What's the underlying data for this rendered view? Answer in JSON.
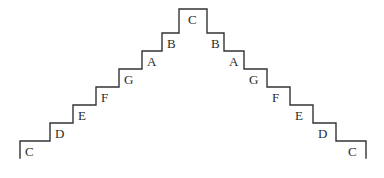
{
  "figure": {
    "kind": "staircase-diagram",
    "line_color": "#333333",
    "label_color": "#2b2b2b",
    "background_color": "#ffffff",
    "stroke_width": 1.4,
    "geometry": {
      "left_start_x": 20,
      "right_end_x": 366,
      "baseline_y": 141,
      "peak_y": 9,
      "tread_width": 23,
      "riser_height": 18,
      "tick_drop": 17
    },
    "steps_ascending": [
      {
        "label": "C",
        "index": 0,
        "tread_y": 141,
        "tread_x1": 20,
        "tread_x2": 50,
        "label_x": 25,
        "label_y": 145
      },
      {
        "label": "D",
        "index": 1,
        "tread_y": 123,
        "tread_x1": 50,
        "tread_x2": 73,
        "label_x": 55,
        "label_y": 127
      },
      {
        "label": "E",
        "index": 2,
        "tread_y": 105,
        "tread_x1": 73,
        "tread_x2": 96,
        "label_x": 78,
        "label_y": 109
      },
      {
        "label": "F",
        "index": 3,
        "tread_y": 87,
        "tread_x1": 96,
        "tread_x2": 119,
        "label_x": 101,
        "label_y": 91
      },
      {
        "label": "G",
        "index": 4,
        "tread_y": 69,
        "tread_x1": 119,
        "tread_x2": 142,
        "label_x": 124,
        "label_y": 73
      },
      {
        "label": "A",
        "index": 5,
        "tread_y": 51,
        "tread_x1": 142,
        "tread_x2": 162,
        "label_x": 147,
        "label_y": 55
      },
      {
        "label": "B",
        "index": 6,
        "tread_y": 33,
        "tread_x1": 162,
        "tread_x2": 179,
        "label_x": 167,
        "label_y": 37
      },
      {
        "label": "C",
        "index": 7,
        "tread_y": 9,
        "tread_x1": 179,
        "tread_x2": 207,
        "label_x": 188,
        "label_y": 13
      }
    ],
    "steps_descending": [
      {
        "label": "B",
        "index": 8,
        "tread_y": 33,
        "tread_x1": 207,
        "tread_x2": 224,
        "label_x": 211,
        "label_y": 37
      },
      {
        "label": "A",
        "index": 9,
        "tread_y": 51,
        "tread_x1": 224,
        "tread_x2": 244,
        "label_x": 229,
        "label_y": 55
      },
      {
        "label": "G",
        "index": 10,
        "tread_y": 69,
        "tread_x1": 244,
        "tread_x2": 267,
        "label_x": 249,
        "label_y": 73
      },
      {
        "label": "F",
        "index": 11,
        "tread_y": 87,
        "tread_x1": 267,
        "tread_x2": 290,
        "label_x": 272,
        "label_y": 91
      },
      {
        "label": "E",
        "index": 12,
        "tread_y": 105,
        "tread_x1": 290,
        "tread_x2": 313,
        "label_x": 295,
        "label_y": 109
      },
      {
        "label": "D",
        "index": 13,
        "tread_y": 123,
        "tread_x1": 313,
        "tread_x2": 336,
        "label_x": 318,
        "label_y": 127
      },
      {
        "label": "C",
        "index": 14,
        "tread_y": 141,
        "tread_x1": 336,
        "tread_x2": 366,
        "label_x": 348,
        "label_y": 145
      }
    ],
    "outline_path": "M 20,158 L 20,141 L 50,141 L 50,123 L 73,123 L 73,105 L 96,105 L 96,87 L 119,87 L 119,69 L 142,69 L 142,51 L 162,51 L 162,33 L 179,33 L 179,9 L 207,9 L 207,33 L 224,33 L 224,51 L 244,51 L 244,69 L 267,69 L 267,87 L 290,87 L 290,105 L 313,105 L 313,123 L 336,123 L 336,141 L 366,141 L 366,158"
  }
}
